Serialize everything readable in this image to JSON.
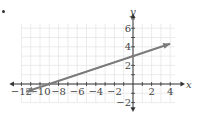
{
  "chart_data": {
    "type": "line",
    "title": "",
    "xlabel": "x",
    "ylabel": "y",
    "xlim": [
      -13,
      4.5
    ],
    "ylim": [
      -2.5,
      7
    ],
    "grid": true,
    "grid_step": 1,
    "x_ticks": [
      -12,
      -10,
      -8,
      -6,
      -4,
      -2,
      2,
      4
    ],
    "x_tick_labels": [
      "−12",
      "−10",
      "−8",
      "−6",
      "−4",
      "−2",
      "2",
      "4"
    ],
    "y_ticks": [
      6,
      4,
      2,
      -2
    ],
    "y_tick_labels": [
      "6",
      "4",
      "2",
      "−2"
    ],
    "series": [
      {
        "name": "line",
        "equation": "y = (1/3)x + 3",
        "slope": 0.3333,
        "intercept": 3,
        "x": [
          -11.5,
          4
        ],
        "y": [
          -0.83,
          4.33
        ],
        "arrows": "both",
        "color": "#7a7a7a"
      }
    ],
    "colors": {
      "axis": "#333333",
      "grid": "#e6e6e6",
      "line": "#7a7a7a"
    }
  }
}
